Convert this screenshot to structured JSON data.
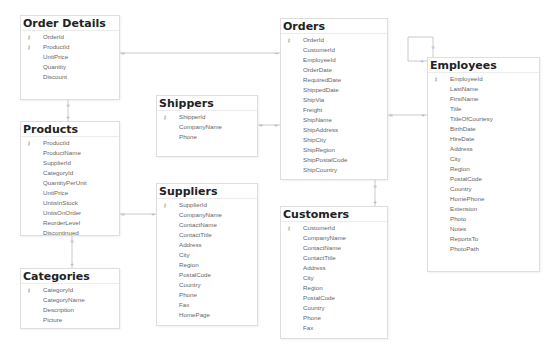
{
  "diagram": {
    "tables": [
      {
        "name": "Order Details",
        "fields": [
          {
            "name": "OrderId",
            "key": true
          },
          {
            "name": "ProductId",
            "key": true
          },
          {
            "name": "UnitPrice"
          },
          {
            "name": "Quantity"
          },
          {
            "name": "Discount"
          }
        ]
      },
      {
        "name": "Products",
        "fields": [
          {
            "name": "ProductId",
            "key": true
          },
          {
            "name": "ProductName"
          },
          {
            "name": "SupplierId"
          },
          {
            "name": "CategoryId"
          },
          {
            "name": "QuantityPerUnit"
          },
          {
            "name": "UnitPrice"
          },
          {
            "name": "UnitsInStock"
          },
          {
            "name": "UnitsOnOrder"
          },
          {
            "name": "ReorderLevel"
          },
          {
            "name": "Discontinued"
          }
        ]
      },
      {
        "name": "Categories",
        "fields": [
          {
            "name": "CategoryId",
            "key": true
          },
          {
            "name": "CategoryName"
          },
          {
            "name": "Description"
          },
          {
            "name": "Picture"
          }
        ]
      },
      {
        "name": "Shippers",
        "fields": [
          {
            "name": "ShipperId",
            "key": true
          },
          {
            "name": "CompanyName"
          },
          {
            "name": "Phone"
          }
        ]
      },
      {
        "name": "Suppliers",
        "fields": [
          {
            "name": "SupplierId",
            "key": true
          },
          {
            "name": "CompanyName"
          },
          {
            "name": "ContactName"
          },
          {
            "name": "ContactTitle"
          },
          {
            "name": "Address"
          },
          {
            "name": "City"
          },
          {
            "name": "Region"
          },
          {
            "name": "PostalCode"
          },
          {
            "name": "Country"
          },
          {
            "name": "Phone"
          },
          {
            "name": "Fax"
          },
          {
            "name": "HomePage"
          }
        ]
      },
      {
        "name": "Orders",
        "fields": [
          {
            "name": "OrderId",
            "key": true
          },
          {
            "name": "CustomerId"
          },
          {
            "name": "EmployeeId"
          },
          {
            "name": "OrderDate"
          },
          {
            "name": "RequiredDate"
          },
          {
            "name": "ShippedDate"
          },
          {
            "name": "ShipVia"
          },
          {
            "name": "Freight"
          },
          {
            "name": "ShipName"
          },
          {
            "name": "ShipAddress"
          },
          {
            "name": "ShipCity"
          },
          {
            "name": "ShipRegion"
          },
          {
            "name": "ShipPostalCode"
          },
          {
            "name": "ShipCountry"
          }
        ]
      },
      {
        "name": "Customers",
        "fields": [
          {
            "name": "CustomerId",
            "key": true
          },
          {
            "name": "CompanyName"
          },
          {
            "name": "ContactName"
          },
          {
            "name": "ContactTitle"
          },
          {
            "name": "Address"
          },
          {
            "name": "City"
          },
          {
            "name": "Region"
          },
          {
            "name": "PostalCode"
          },
          {
            "name": "Country"
          },
          {
            "name": "Phone"
          },
          {
            "name": "Fax"
          }
        ]
      },
      {
        "name": "Employees",
        "fields": [
          {
            "name": "EmployeeId",
            "key": true
          },
          {
            "name": "LastName"
          },
          {
            "name": "FirstName"
          },
          {
            "name": "Title"
          },
          {
            "name": "TitleOfCourtesy"
          },
          {
            "name": "BirthDate"
          },
          {
            "name": "HireDate"
          },
          {
            "name": "Address"
          },
          {
            "name": "City"
          },
          {
            "name": "Region"
          },
          {
            "name": "PostalCode"
          },
          {
            "name": "Country"
          },
          {
            "name": "HomePhone"
          },
          {
            "name": "Extension"
          },
          {
            "name": "Photo"
          },
          {
            "name": "Notes"
          },
          {
            "name": "ReportsTo"
          },
          {
            "name": "PhotoPath"
          }
        ]
      }
    ],
    "key_icon": "key-icon",
    "relationships": [
      {
        "from": "Order Details",
        "to": "Orders"
      },
      {
        "from": "Order Details",
        "to": "Products"
      },
      {
        "from": "Products",
        "to": "Categories"
      },
      {
        "from": "Products",
        "to": "Suppliers"
      },
      {
        "from": "Orders",
        "to": "Shippers"
      },
      {
        "from": "Orders",
        "to": "Customers"
      },
      {
        "from": "Orders",
        "to": "Employees"
      },
      {
        "from": "Employees",
        "to": "Employees"
      }
    ]
  }
}
